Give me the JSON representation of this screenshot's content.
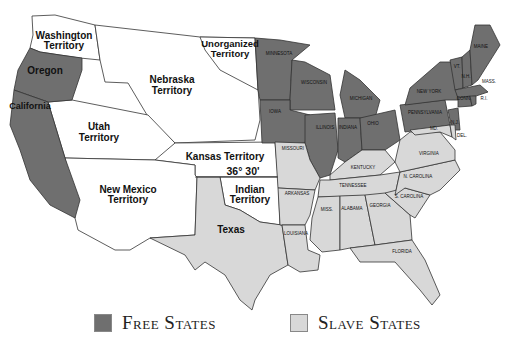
{
  "map": {
    "title": "Free and Slave States and Territories",
    "colors": {
      "free": "#6f6f6f",
      "slave": "#d8d8d8",
      "territory": "#ffffff",
      "border": "#333333"
    },
    "territories": [
      {
        "name": "Washington Territory",
        "line1": "Washington",
        "line2": "Territory"
      },
      {
        "name": "Unorganized Territory",
        "line1": "Unorganized",
        "line2": "Territory"
      },
      {
        "name": "Nebraska Territory",
        "line1": "Nebraska",
        "line2": "Territory"
      },
      {
        "name": "Utah Territory",
        "line1": "Utah",
        "line2": "Territory"
      },
      {
        "name": "Kansas Territory",
        "line1": "Kansas Territory"
      },
      {
        "name": "New Mexico Territory",
        "line1": "New Mexico",
        "line2": "Territory"
      },
      {
        "name": "Indian Territory",
        "line1": "Indian",
        "line2": "Territory"
      }
    ],
    "free_states": [
      "Oregon",
      "California",
      "MINNESOTA",
      "WISCONSIN",
      "IOWA",
      "MICHIGAN",
      "ILLINOIS",
      "INDIANA",
      "OHIO",
      "PENNSYLVANIA",
      "NEW YORK",
      "N.J.",
      "VT.",
      "N.H.",
      "MAINE",
      "MASS.",
      "CONN.",
      "R.I."
    ],
    "slave_states": [
      "Texas",
      "MISSOURI",
      "ARKANSAS",
      "LOUISIANA",
      "KENTUCKY",
      "TENNESSEE",
      "MISS.",
      "ALABAMA",
      "GEORGIA",
      "FLORIDA",
      "S. CAROLINA",
      "N. CAROLINA",
      "VIRGINIA",
      "MD.",
      "DEL."
    ],
    "compromise_line": "36° 30'"
  },
  "legend": {
    "free_label": "Free States",
    "slave_label": "Slave States"
  }
}
